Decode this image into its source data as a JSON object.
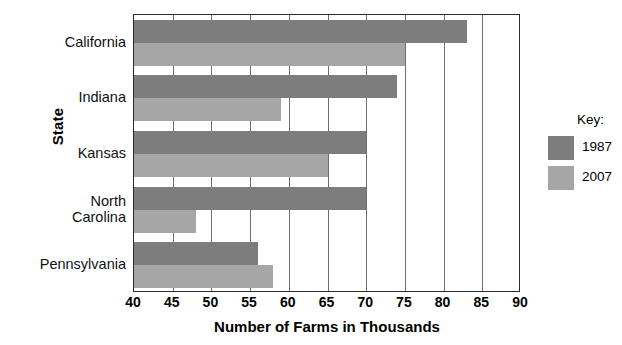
{
  "chart_data": {
    "type": "bar",
    "orientation": "horizontal",
    "title": "",
    "xlabel": "Number of Farms in Thousands",
    "ylabel": "State",
    "categories": [
      "California",
      "Indiana",
      "Kansas",
      "North Carolina",
      "Pennsylvania"
    ],
    "category_label_lines": [
      [
        "California"
      ],
      [
        "Indiana"
      ],
      [
        "Kansas"
      ],
      [
        "North",
        "Carolina"
      ],
      [
        "Pennsylvania"
      ]
    ],
    "series": [
      {
        "name": "1987",
        "color": "#7d7d7d",
        "values": [
          83,
          74,
          70,
          70,
          56
        ]
      },
      {
        "name": "2007",
        "color": "#a6a6a6",
        "values": [
          75,
          59,
          65,
          48,
          58
        ]
      }
    ],
    "xlim": [
      40,
      90
    ],
    "xticks": [
      40,
      45,
      50,
      55,
      60,
      65,
      70,
      75,
      80,
      85,
      90
    ],
    "xtick_labels": [
      "40",
      "45",
      "50",
      "55",
      "60",
      "65",
      "70",
      "75",
      "80",
      "85",
      "90"
    ],
    "grid": true,
    "grid_axis": "x",
    "legend": {
      "title": "Key:",
      "position": "right",
      "entries": [
        {
          "label": "1987",
          "color": "#7d7d7d"
        },
        {
          "label": "2007",
          "color": "#a6a6a6"
        }
      ]
    }
  }
}
